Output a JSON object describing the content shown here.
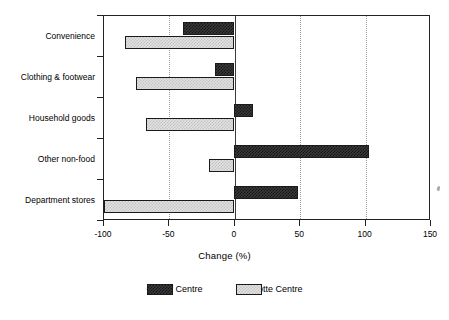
{
  "chart_data": {
    "type": "bar",
    "orientation": "horizontal",
    "title": "",
    "xlabel": "Change (%)",
    "ylabel": "",
    "xlim": [
      -100,
      150
    ],
    "xticks": [
      -100,
      -50,
      0,
      50,
      100,
      150
    ],
    "xticklabels": [
      "-100",
      "-50",
      "0",
      "50",
      "100",
      "150"
    ],
    "grid": "vertical-dotted",
    "zero_line": 0,
    "legend_position": "bottom-center",
    "categories": [
      "Convenience",
      "Clothing & footwear",
      "Household goods",
      "Other non-food",
      "Department stores"
    ],
    "series": [
      {
        "name": "Cardiff Centre",
        "fill": "dark-checker",
        "color": "#3a3a3a",
        "values": [
          -39,
          -14,
          15,
          103,
          49
        ]
      },
      {
        "name": "Charlotte Centre",
        "fill": "light-checker",
        "color": "#e2e2e2",
        "values": [
          -83,
          -75,
          -67,
          -19,
          -99
        ]
      }
    ]
  },
  "legend": {
    "items": [
      {
        "label": "Cardiff Centre",
        "swatch": "dark-checker"
      },
      {
        "label": "Charlotte Centre",
        "swatch": "light-checker"
      }
    ]
  },
  "axis": {
    "x_title": "Change (%)"
  }
}
